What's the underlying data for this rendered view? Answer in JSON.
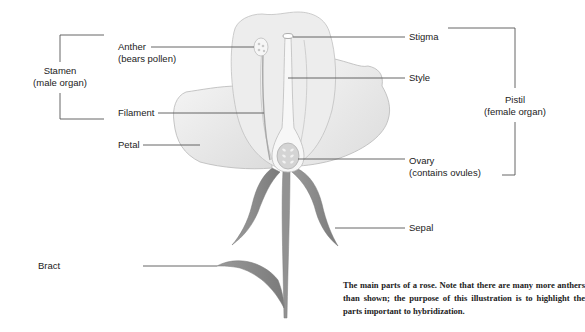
{
  "diagram": {
    "title": "Parts of a rose",
    "labels": {
      "anther": "Anther",
      "anther_note": "(bears pollen)",
      "filament": "Filament",
      "petal": "Petal",
      "bract": "Bract",
      "stigma": "Stigma",
      "style": "Style",
      "ovary": "Ovary",
      "ovary_note": "(contains ovules)",
      "sepal": "Sepal"
    },
    "groups": {
      "stamen": {
        "name": "Stamen",
        "note": "(male organ)"
      },
      "pistil": {
        "name": "Pistil",
        "note": "(female organ)"
      }
    },
    "caption": "The main parts of a rose. Note that there are many more anthers than shown; the purpose of this illustration is to highlight the parts important to hybridization."
  },
  "colors": {
    "petal_fill": "#ececec",
    "petal_stroke": "#b5b5b5",
    "stem": "#8c8c8c",
    "leader_line": "#555555"
  }
}
